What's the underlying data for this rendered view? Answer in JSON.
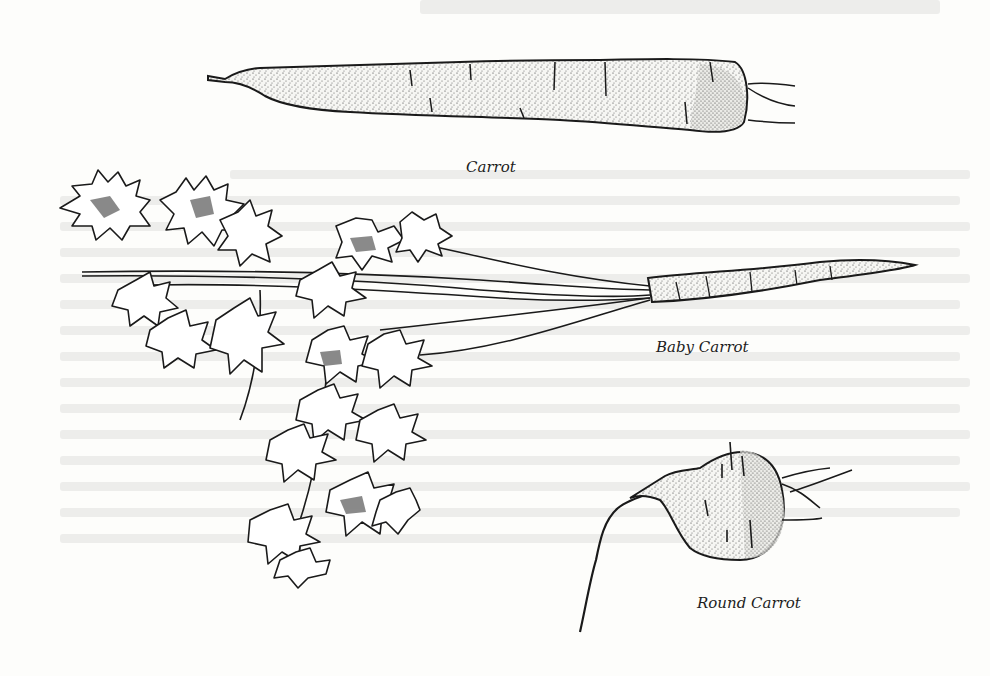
{
  "page": {
    "background_color": "#fdfdfb",
    "ink_color": "#1a1a1a"
  },
  "illustrations": [
    {
      "id": "carrot",
      "caption": "Carrot"
    },
    {
      "id": "baby-carrot",
      "caption": "Baby Carrot"
    },
    {
      "id": "round-carrot",
      "caption": "Round Carrot"
    }
  ]
}
